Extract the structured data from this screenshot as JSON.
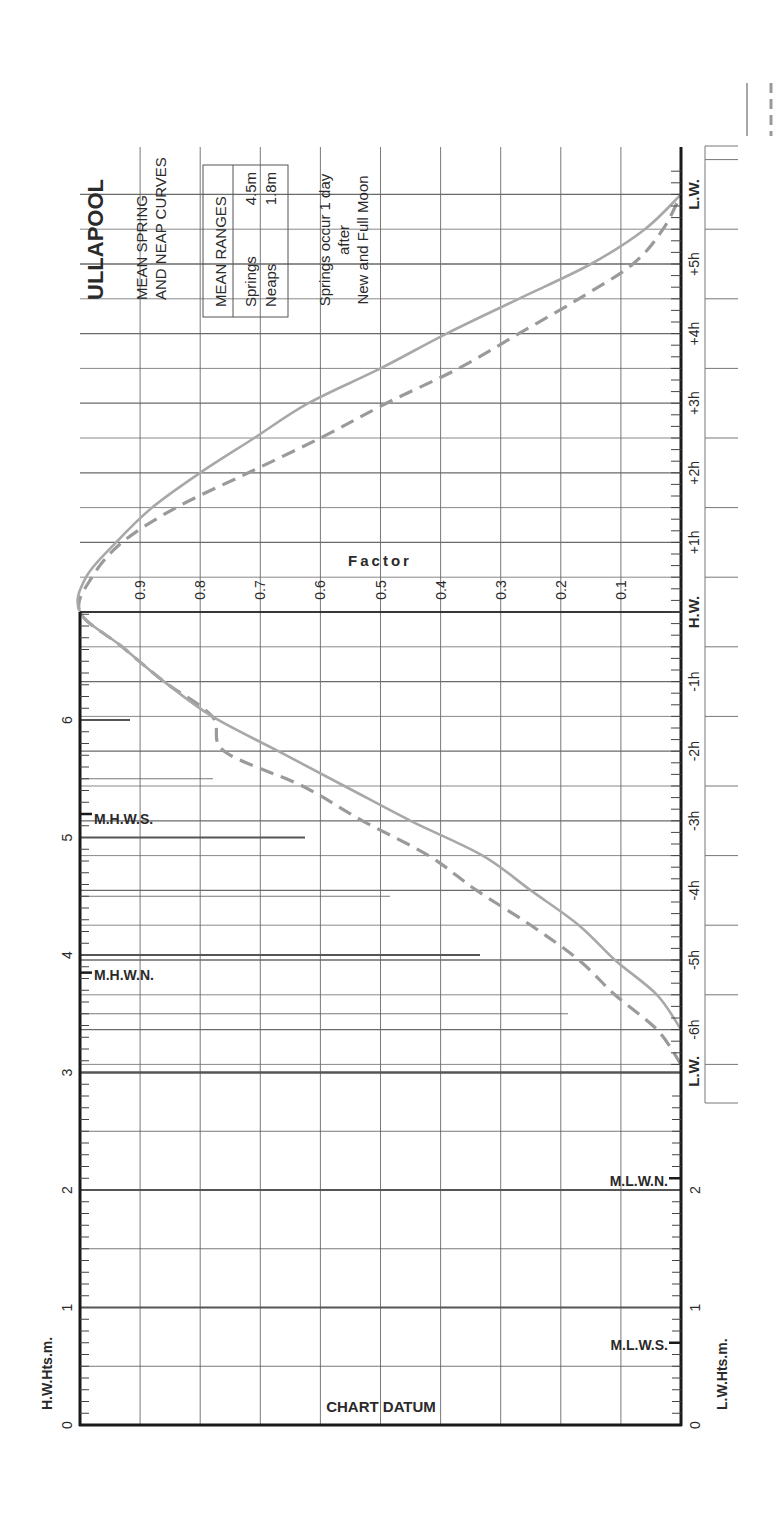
{
  "title": "ULLAPOOL",
  "subtitle_line1": "MEAN SPRING",
  "subtitle_line2": "AND NEAP CURVES",
  "ranges_box": {
    "header": "MEAN RANGES",
    "rows": [
      {
        "label": "Springs",
        "value": "4.5m"
      },
      {
        "label": "Neaps",
        "value": "1.8m"
      }
    ]
  },
  "note_line1": "Springs occur 1 day",
  "note_line2": "after",
  "note_line3": "New and Full Moon",
  "factor_label": "Factor",
  "chart_datum_label": "CHART DATUM",
  "hw_axis_label": "H.W.Hts.m.",
  "lw_axis_label": "L.W.Hts.m.",
  "markers": {
    "mhws": "M.H.W.S.",
    "mhwn": "M.H.W.N.",
    "mlwn": "M.L.W.N.",
    "mlws": "M.L.W.S."
  },
  "colors": {
    "axis": "#1a1a1a",
    "grid": "#6a6a6a",
    "spring_curve": "#a8a8a8",
    "neap_curve": "#9a9a9a"
  },
  "chart_data": {
    "type": "line",
    "xlabel": "Time relative to H.W. (hours)",
    "ylabel": "Factor",
    "time_labels": [
      "L.W.",
      "-6h",
      "-5h",
      "-4h",
      "-3h",
      "-2h",
      "-1h",
      "H.W.",
      "+1h",
      "+2h",
      "+3h",
      "+4h",
      "+5h",
      "L.W."
    ],
    "factor_ticks": [
      "0.9",
      "0.8",
      "0.7",
      "0.6",
      "0.5",
      "0.4",
      "0.3",
      "0.2",
      "0.1"
    ],
    "hw_height_ticks": [
      "0",
      "1",
      "2",
      "3",
      "4",
      "5",
      "6"
    ],
    "lw_height_ticks": [
      "0",
      "1",
      "2"
    ],
    "x": [
      -6.5,
      -6,
      -5.5,
      -5,
      -4.5,
      -4,
      -3.5,
      -3,
      -2.5,
      -2,
      -1.5,
      -1,
      -0.5,
      0,
      0.5,
      1,
      1.5,
      2,
      2.5,
      3,
      3.5,
      4,
      4.5,
      5,
      5.5,
      6
    ],
    "series": [
      {
        "name": "Springs",
        "style": "solid",
        "values": [
          null,
          0.0,
          0.04,
          0.11,
          0.17,
          0.25,
          0.33,
          0.45,
          0.56,
          0.67,
          0.78,
          0.86,
          0.93,
          1.0,
          0.99,
          0.94,
          0.88,
          0.8,
          0.71,
          0.62,
          0.5,
          0.39,
          0.27,
          0.15,
          0.06,
          0.0
        ]
      },
      {
        "name": "Neaps",
        "style": "dashed",
        "values": [
          0.0,
          0.04,
          0.11,
          0.17,
          0.25,
          0.34,
          0.42,
          0.53,
          0.63,
          0.76,
          0.78,
          0.86,
          0.93,
          1.0,
          0.98,
          0.93,
          0.84,
          0.72,
          0.6,
          0.49,
          0.37,
          0.27,
          0.17,
          0.08,
          0.03,
          0.0
        ]
      }
    ],
    "mean_ranges": {
      "springs_m": 4.5,
      "neaps_m": 1.8
    },
    "levels_m": {
      "MHWS": 5.2,
      "MHWN": 3.9,
      "MLWN": 2.1,
      "MLWS": 0.7
    }
  }
}
